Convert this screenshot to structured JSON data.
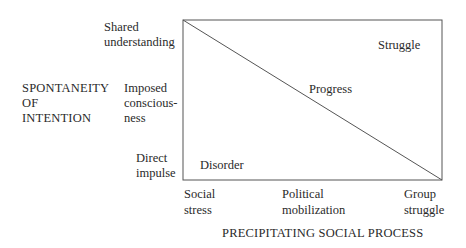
{
  "diagram": {
    "x_axis": {
      "title": "PRECIPITATING SOCIAL PROCESS",
      "ticks": [
        {
          "line1": "Social",
          "line2": "stress"
        },
        {
          "line1": "Political",
          "line2": "mobilization"
        },
        {
          "line1": "Group",
          "line2": "struggle"
        }
      ]
    },
    "y_axis": {
      "title_lines": [
        "SPONTANEITY",
        "OF",
        "INTENTION"
      ],
      "ticks": [
        {
          "line1": "Shared",
          "line2": "understanding"
        },
        {
          "line1": "Imposed",
          "line2": "conscious-",
          "line3": "ness"
        },
        {
          "line1": "Direct",
          "line2": "impulse"
        }
      ]
    },
    "regions": {
      "top_right": "Struggle",
      "diagonal": "Progress",
      "bottom_left": "Disorder"
    },
    "colors": {
      "line": "#555555",
      "text": "#2a2a2a"
    }
  }
}
